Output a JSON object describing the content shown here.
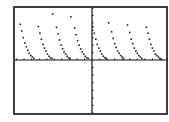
{
  "screen": {
    "width": 169,
    "height": 122,
    "background": "#ffffff",
    "frame": {
      "x": 14,
      "y": 7,
      "width": 153,
      "height": 107,
      "stroke": "#111111",
      "stroke_width": 1.6
    },
    "axis_color": "#111111",
    "dot_color": "#222222"
  },
  "chart_data": {
    "type": "scatter",
    "mode": "dot",
    "title": "",
    "xlabel": "",
    "ylabel": "",
    "grid": false,
    "legend": null,
    "xlim": [
      -10,
      10
    ],
    "ylim": [
      -7,
      7
    ],
    "x_axis_pixel_y": 60,
    "y_axis_pixel_x": 92,
    "x_ticks": {
      "count": 20,
      "spacing": 1
    },
    "y_ticks": {
      "count": 14,
      "spacing": 1
    },
    "period": 2.4,
    "series": [
      {
        "name": "f(x)",
        "arcs": [
          {
            "x": [
              -9.5,
              -9.3,
              -9.1,
              -8.9,
              -8.7,
              -8.5,
              -8.3,
              -8.1,
              -7.9,
              -7.7
            ],
            "y": [
              4.8,
              3.9,
              3.0,
              2.3,
              1.8,
              1.3,
              0.9,
              0.6,
              0.4,
              0.2
            ]
          },
          {
            "x": [
              -7.1,
              -6.9,
              -6.7,
              -6.5,
              -6.3,
              -6.1,
              -5.9,
              -5.7,
              -5.5,
              -5.3
            ],
            "y": [
              4.5,
              3.6,
              2.8,
              2.1,
              1.6,
              1.2,
              0.8,
              0.5,
              0.3,
              0.2
            ]
          },
          {
            "x": [
              -5.2,
              -4.7,
              -4.5,
              -4.3,
              -4.1,
              -3.9,
              -3.7,
              -3.5,
              -3.3,
              -3.1,
              -2.9
            ],
            "y": [
              6.2,
              4.4,
              3.5,
              2.7,
              2.0,
              1.5,
              1.1,
              0.8,
              0.5,
              0.3,
              0.2
            ]
          },
          {
            "x": [
              -2.8,
              -2.3,
              -2.1,
              -1.9,
              -1.7,
              -1.5,
              -1.3,
              -1.1,
              -0.9,
              -0.7,
              -0.5
            ],
            "y": [
              5.8,
              4.3,
              3.4,
              2.6,
              2.0,
              1.5,
              1.1,
              0.8,
              0.5,
              0.3,
              0.2
            ]
          },
          {
            "x": [
              0.1,
              0.3,
              0.5,
              0.7,
              0.9,
              1.1,
              1.3,
              1.5,
              1.7,
              1.9
            ],
            "y": [
              4.5,
              3.6,
              2.8,
              2.1,
              1.6,
              1.2,
              0.8,
              0.5,
              0.3,
              0.2
            ]
          },
          {
            "x": [
              2.2,
              2.6,
              2.8,
              3.0,
              3.2,
              3.4,
              3.6,
              3.8,
              4.0,
              4.2
            ],
            "y": [
              5.0,
              3.8,
              2.9,
              2.2,
              1.7,
              1.2,
              0.9,
              0.6,
              0.4,
              0.2
            ]
          },
          {
            "x": [
              4.7,
              5.0,
              5.2,
              5.4,
              5.6,
              5.8,
              6.0,
              6.2,
              6.4,
              6.6
            ],
            "y": [
              4.7,
              3.7,
              2.8,
              2.2,
              1.6,
              1.2,
              0.9,
              0.6,
              0.4,
              0.2
            ]
          },
          {
            "x": [
              7.2,
              7.4,
              7.6,
              7.8,
              8.0,
              8.2,
              8.4,
              8.6,
              8.8,
              9.0,
              9.2
            ],
            "y": [
              4.4,
              3.6,
              2.8,
              2.1,
              1.6,
              1.2,
              0.8,
              0.6,
              0.4,
              0.2,
              0.1
            ]
          }
        ]
      }
    ]
  }
}
